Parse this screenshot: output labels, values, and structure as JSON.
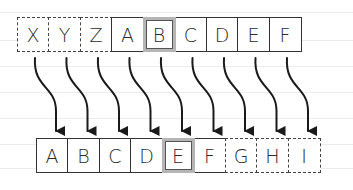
{
  "diagram": {
    "type": "shift-mapping",
    "shift": 3,
    "top_row": [
      {
        "letter": "X",
        "style": "dashed"
      },
      {
        "letter": "Y",
        "style": "dashed"
      },
      {
        "letter": "Z",
        "style": "dashed"
      },
      {
        "letter": "A",
        "style": "solid"
      },
      {
        "letter": "B",
        "style": "highlight"
      },
      {
        "letter": "C",
        "style": "solid"
      },
      {
        "letter": "D",
        "style": "solid"
      },
      {
        "letter": "E",
        "style": "solid"
      },
      {
        "letter": "F",
        "style": "solid"
      }
    ],
    "bottom_row": [
      {
        "letter": "A",
        "style": "solid"
      },
      {
        "letter": "B",
        "style": "solid"
      },
      {
        "letter": "C",
        "style": "solid"
      },
      {
        "letter": "D",
        "style": "solid"
      },
      {
        "letter": "E",
        "style": "highlight"
      },
      {
        "letter": "F",
        "style": "solid"
      },
      {
        "letter": "G",
        "style": "dashed"
      },
      {
        "letter": "H",
        "style": "dashed"
      },
      {
        "letter": "I",
        "style": "dashed"
      }
    ],
    "arrows": [
      {
        "from": "X",
        "to": "A"
      },
      {
        "from": "Y",
        "to": "B"
      },
      {
        "from": "Z",
        "to": "C"
      },
      {
        "from": "A",
        "to": "D"
      },
      {
        "from": "B",
        "to": "E"
      },
      {
        "from": "C",
        "to": "F"
      },
      {
        "from": "D",
        "to": "G"
      },
      {
        "from": "E",
        "to": "H"
      },
      {
        "from": "F",
        "to": "I"
      }
    ],
    "colors": {
      "ink": "#2b2b2b",
      "highlight_border": "#b5b5b5",
      "ruling": "#ececec"
    }
  }
}
